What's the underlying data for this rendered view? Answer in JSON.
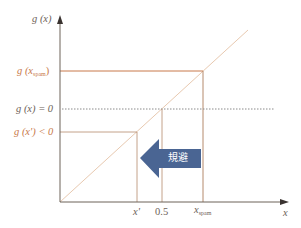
{
  "diagram": {
    "y_axis_label": "g (x)",
    "x_axis_label": "x",
    "y_labels": {
      "g_spam": {
        "prefix": "g (x",
        "sub": "spam",
        "suffix": ")"
      },
      "g_zero": "g (x) = 0",
      "g_xprime": "g (x') < 0"
    },
    "x_labels": {
      "x_prime": "x'",
      "half": "0.5",
      "x_spam": {
        "main": "x",
        "sub": "spam"
      }
    },
    "arrow_label": "規避",
    "colors": {
      "axis": "#6d6258",
      "diagonal": "#e8c9b0",
      "guide_lines": "#b58a6c",
      "spam_line": "#c8794a",
      "dotted": "#8a8a8a",
      "arrow_fill": "#4a6593"
    }
  }
}
